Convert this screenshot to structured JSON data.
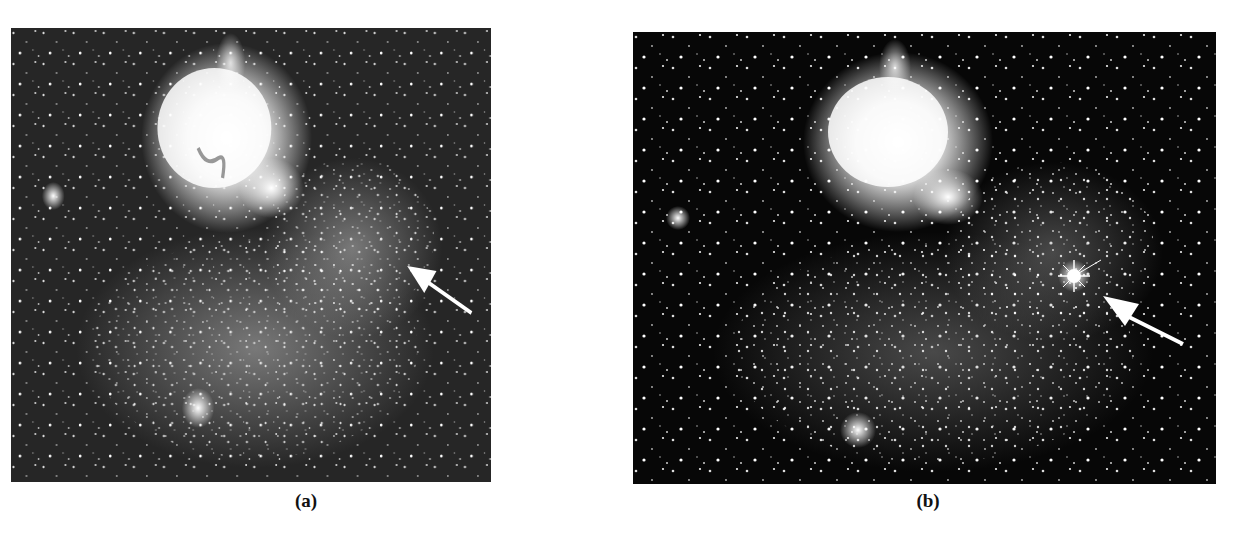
{
  "figure": {
    "panels": [
      {
        "id": "a",
        "caption_label": "(a)",
        "description": "Star field of a nebula region before event; arrow marks target location with no bright star",
        "background_color": "#262626",
        "arrow": {
          "present": true,
          "points_to": "faint region, no bright star",
          "color": "#ffffff"
        }
      },
      {
        "id": "b",
        "caption_label": "(b)",
        "description": "Same star field after event; arrow points to a new bright star with diffraction spikes",
        "background_color": "#070707",
        "arrow": {
          "present": true,
          "points_to": "bright star with diffraction spikes",
          "color": "#ffffff"
        }
      }
    ]
  }
}
